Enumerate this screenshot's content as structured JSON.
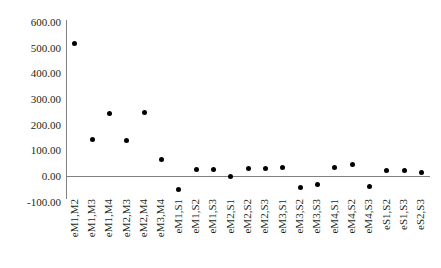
{
  "chart_data": {
    "type": "scatter",
    "title": "",
    "xlabel": "",
    "ylabel": "",
    "ylim": [
      -100,
      600
    ],
    "grid": false,
    "legend": "none",
    "ytick_labels": [
      "600.00",
      "500.00",
      "400.00",
      "300.00",
      "200.00",
      "100.00",
      "0.00",
      "-100.00"
    ],
    "ytick_values": [
      600,
      500,
      400,
      300,
      200,
      100,
      0,
      -100
    ],
    "categories": [
      "eM1,M2",
      "eM1,M3",
      "eM1,M4",
      "eM2,M3",
      "eM2,M4",
      "eM3,M4",
      "eM1,S1",
      "eM1,S2",
      "eM1,S3",
      "eM2,S1",
      "eM2,S2",
      "eM2,S3",
      "eM3,S1",
      "eM3,S2",
      "eM3,S3",
      "eM4,S1",
      "eM4,S2",
      "eM4,S3",
      "eS1,S2",
      "eS1,S3",
      "eS2,S3"
    ],
    "values": [
      518,
      144,
      245,
      137,
      249,
      66,
      -51,
      27,
      27,
      0,
      31,
      31,
      35,
      -43,
      -35,
      35,
      43,
      -39,
      20,
      20,
      12
    ]
  }
}
